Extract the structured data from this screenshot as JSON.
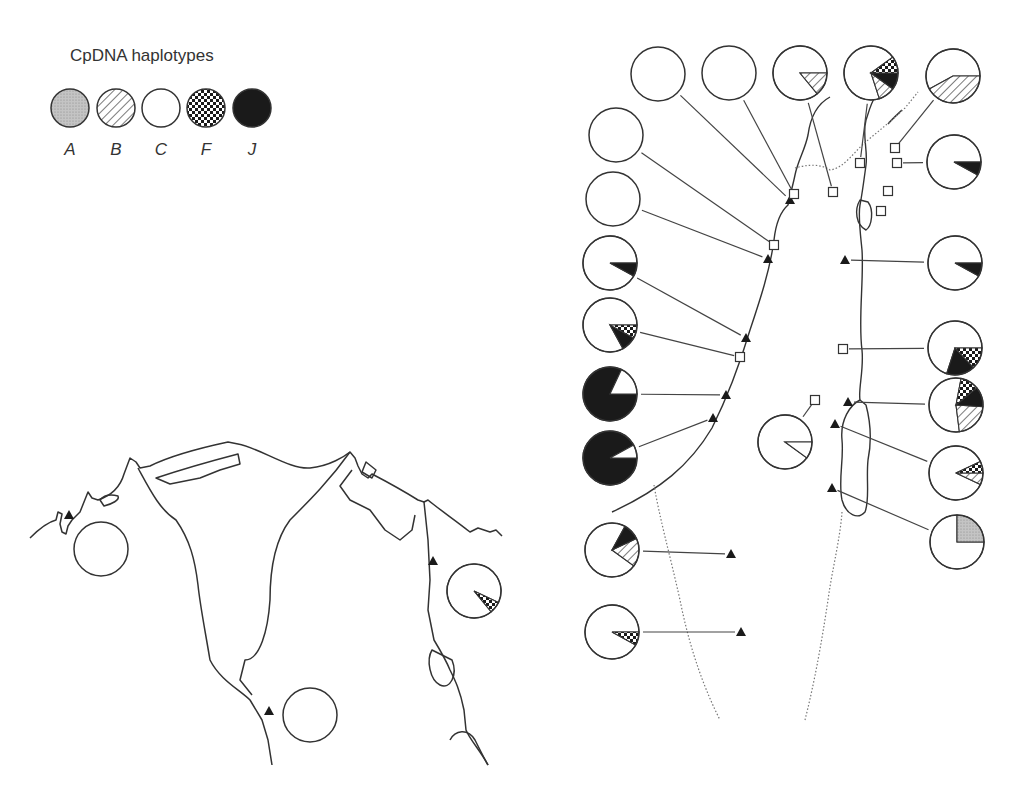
{
  "legend": {
    "title": "CpDNA haplotypes",
    "items": [
      {
        "key": "A",
        "label": "A",
        "fill": "dots"
      },
      {
        "key": "B",
        "label": "B",
        "fill": "hatch"
      },
      {
        "key": "C",
        "label": "C",
        "fill": "white"
      },
      {
        "key": "F",
        "label": "F",
        "fill": "checker"
      },
      {
        "key": "J",
        "label": "J",
        "fill": "black"
      }
    ]
  },
  "colors": {
    "line": "#333333",
    "black": "#1a1a1a",
    "dots": "#bdbdbd"
  },
  "left_map": {
    "sites": [
      {
        "marker": "triangle",
        "mx": 69,
        "my": 515,
        "pie": {
          "cx": 101,
          "cy": 549,
          "slices": [
            {
              "h": "C",
              "f": 1
            }
          ]
        }
      },
      {
        "marker": "triangle",
        "mx": 433,
        "my": 561,
        "pie": {
          "cx": 474,
          "cy": 591,
          "slices": [
            {
              "h": "C",
              "f": 0.93
            },
            {
              "h": "F",
              "f": 0.07
            }
          ],
          "start": -0.07
        }
      },
      {
        "marker": "triangle",
        "mx": 269,
        "my": 711,
        "pie": {
          "cx": 310,
          "cy": 715,
          "slices": [
            {
              "h": "C",
              "f": 1
            }
          ]
        }
      }
    ]
  },
  "right_map": {
    "sites": [
      {
        "marker": "triangle",
        "mx": 790,
        "my": 200,
        "pie": {
          "cx": 658,
          "cy": 74,
          "slices": [
            {
              "h": "C",
              "f": 1
            }
          ]
        }
      },
      {
        "marker": "square",
        "mx": 794,
        "my": 194,
        "pie": {
          "cx": 729,
          "cy": 73,
          "slices": [
            {
              "h": "C",
              "f": 1
            }
          ]
        }
      },
      {
        "marker": "square",
        "mx": 833,
        "my": 192,
        "pie": {
          "cx": 800,
          "cy": 73,
          "slices": [
            {
              "h": "C",
              "f": 0.86
            },
            {
              "h": "B",
              "f": 0.14
            }
          ],
          "start": 0
        }
      },
      {
        "marker": "square",
        "mx": 860,
        "my": 163,
        "pie": {
          "cx": 871,
          "cy": 73,
          "slices": [
            {
              "h": "C",
              "f": 0.7
            },
            {
              "h": "B",
              "f": 0.1
            },
            {
              "h": "J",
              "f": 0.1
            },
            {
              "h": "F",
              "f": 0.1
            }
          ],
          "start": 0.1
        }
      },
      {
        "marker": "square",
        "mx": 895,
        "my": 148,
        "pie": {
          "cx": 953,
          "cy": 76,
          "slices": [
            {
              "h": "C",
              "f": 0.58
            },
            {
              "h": "B",
              "f": 0.42
            }
          ],
          "start": 0
        }
      },
      {
        "marker": "square",
        "mx": 897,
        "my": 163,
        "pie": {
          "cx": 954,
          "cy": 162,
          "slices": [
            {
              "h": "C",
              "f": 0.92
            },
            {
              "h": "J",
              "f": 0.08
            }
          ],
          "start": 0
        }
      },
      {
        "marker": "square",
        "mx": 888,
        "my": 191,
        "pie": null
      },
      {
        "marker": "square",
        "mx": 881,
        "my": 211,
        "pie": null
      },
      {
        "marker": "square",
        "mx": 774,
        "my": 245,
        "pie": {
          "cx": 616,
          "cy": 135,
          "slices": [
            {
              "h": "C",
              "f": 1
            }
          ]
        }
      },
      {
        "marker": "triangle",
        "mx": 768,
        "my": 259,
        "pie": {
          "cx": 613,
          "cy": 199,
          "slices": [
            {
              "h": "C",
              "f": 1
            }
          ]
        }
      },
      {
        "marker": "triangle",
        "mx": 746,
        "my": 338,
        "pie": {
          "cx": 610,
          "cy": 263,
          "slices": [
            {
              "h": "C",
              "f": 0.92
            },
            {
              "h": "J",
              "f": 0.08
            }
          ],
          "start": 0
        }
      },
      {
        "marker": "square",
        "mx": 740,
        "my": 357,
        "pie": {
          "cx": 610,
          "cy": 325,
          "slices": [
            {
              "h": "C",
              "f": 0.83
            },
            {
              "h": "J",
              "f": 0.09
            },
            {
              "h": "F",
              "f": 0.08
            }
          ],
          "start": 0
        }
      },
      {
        "marker": "triangle",
        "mx": 726,
        "my": 395,
        "pie": {
          "cx": 610,
          "cy": 394,
          "slices": [
            {
              "h": "J",
              "f": 0.82
            },
            {
              "h": "C",
              "f": 0.18
            }
          ],
          "start": -0.82
        }
      },
      {
        "marker": "triangle",
        "mx": 713,
        "my": 418,
        "pie": {
          "cx": 610,
          "cy": 458,
          "slices": [
            {
              "h": "J",
              "f": 0.92
            },
            {
              "h": "C",
              "f": 0.08
            }
          ],
          "start": -0.92
        }
      },
      {
        "marker": "triangle",
        "mx": 845,
        "my": 260,
        "pie": {
          "cx": 955,
          "cy": 263,
          "slices": [
            {
              "h": "C",
              "f": 0.92
            },
            {
              "h": "J",
              "f": 0.08
            }
          ],
          "start": 0
        }
      },
      {
        "marker": "square",
        "mx": 843,
        "my": 349,
        "pie": {
          "cx": 955,
          "cy": 348,
          "slices": [
            {
              "h": "C",
              "f": 0.7
            },
            {
              "h": "J",
              "f": 0.17
            },
            {
              "h": "F",
              "f": 0.13
            }
          ],
          "start": 0
        }
      },
      {
        "marker": "triangle",
        "mx": 848,
        "my": 402,
        "pie": {
          "cx": 956,
          "cy": 405,
          "slices": [
            {
              "h": "C",
              "f": 0.55
            },
            {
              "h": "B",
              "f": 0.22
            },
            {
              "h": "J",
              "f": 0.12
            },
            {
              "h": "F",
              "f": 0.11
            }
          ],
          "start": 0.22
        }
      },
      {
        "marker": "square",
        "mx": 815,
        "my": 400,
        "pie": {
          "cx": 785,
          "cy": 442,
          "slices": [
            {
              "h": "C",
              "f": 0.9
            },
            {
              "h": "C",
              "f": 0.1
            }
          ],
          "start": 0
        }
      },
      {
        "marker": "triangle",
        "mx": 835,
        "my": 424,
        "pie": {
          "cx": 956,
          "cy": 473,
          "slices": [
            {
              "h": "C",
              "f": 0.86
            },
            {
              "h": "B",
              "f": 0.07
            },
            {
              "h": "F",
              "f": 0.07
            }
          ],
          "start": 0.07
        }
      },
      {
        "marker": "triangle",
        "mx": 832,
        "my": 488,
        "pie": {
          "cx": 957,
          "cy": 542,
          "slices": [
            {
              "h": "C",
              "f": 0.75
            },
            {
              "h": "A",
              "f": 0.25
            }
          ],
          "start": 0.25
        }
      },
      {
        "marker": "triangle",
        "mx": 731,
        "my": 554,
        "pie": {
          "cx": 612,
          "cy": 550,
          "slices": [
            {
              "h": "C",
              "f": 0.73
            },
            {
              "h": "B",
              "f": 0.17
            },
            {
              "h": "J",
              "f": 0.1
            }
          ],
          "start": 0.17
        }
      },
      {
        "marker": "triangle",
        "mx": 741,
        "my": 632,
        "pie": {
          "cx": 612,
          "cy": 632,
          "slices": [
            {
              "h": "C",
              "f": 0.92
            },
            {
              "h": "F",
              "f": 0.08
            }
          ],
          "start": 0
        }
      }
    ]
  }
}
